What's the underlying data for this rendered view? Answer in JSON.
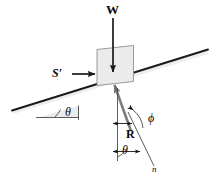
{
  "figure": {
    "background_color": "#ffffff",
    "ink_color": "#1a1a1a",
    "block_fill_color": "#e8e8e8",
    "shadow_color": "#d9d9d9"
  },
  "labels": {
    "weight": "W",
    "applied_force": "S′",
    "reaction": "R",
    "incline_angle": "θ",
    "normal_angle": "θ",
    "friction_angle": "ϕ",
    "normal_line": "n"
  },
  "elements": {
    "incline_surface": "incline-surface",
    "horizontal_reference": "horizontal-reference-line",
    "vertical_reference": "vertical-reference-line",
    "block": "block",
    "weight_arrow": "weight-arrow",
    "applied_force_arrow": "applied-force-arrow",
    "reaction_arrow": "reaction-arrow",
    "normal_direction_line": "normal-direction-line",
    "incline_angle_arc": "incline-angle-arc",
    "friction_angle_arc": "friction-angle-arc",
    "normal_angle_arc": "normal-angle-arc"
  }
}
